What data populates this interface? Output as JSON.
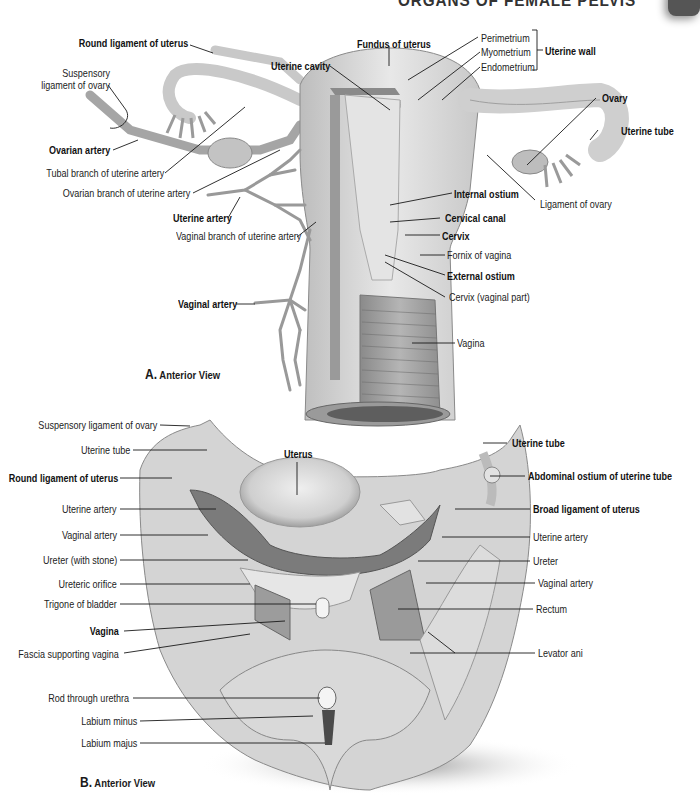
{
  "header": {
    "title": "ORGANS OF FEMALE PELVIS"
  },
  "figure_a": {
    "caption_letter": "A.",
    "caption_text": "Anterior View",
    "labels": [
      {
        "id": "round-ligament-of-uterus",
        "text": "Round ligament of uterus",
        "bold": true
      },
      {
        "id": "suspensory-ligament-of-ovary",
        "text": "Suspensory\nligament of ovary",
        "bold": false
      },
      {
        "id": "ovarian-artery",
        "text": "Ovarian artery",
        "bold": true
      },
      {
        "id": "tubal-branch-of-uterine-artery",
        "text": "Tubal branch of uterine artery",
        "bold": false
      },
      {
        "id": "ovarian-branch-of-uterine-artery",
        "text": "Ovarian branch of uterine artery",
        "bold": false
      },
      {
        "id": "uterine-artery",
        "text": "Uterine artery",
        "bold": true
      },
      {
        "id": "vaginal-branch-of-uterine-artery",
        "text": "Vaginal branch of uterine artery",
        "bold": false
      },
      {
        "id": "vaginal-artery",
        "text": "Vaginal artery",
        "bold": true
      },
      {
        "id": "uterine-cavity",
        "text": "Uterine cavity",
        "bold": true
      },
      {
        "id": "fundus-of-uterus",
        "text": "Fundus of uterus",
        "bold": true
      },
      {
        "id": "perimetrium",
        "text": "Perimetrium",
        "bold": false
      },
      {
        "id": "myometrium",
        "text": "Myometrium",
        "bold": false
      },
      {
        "id": "endometrium",
        "text": "Endometrium",
        "bold": false
      },
      {
        "id": "uterine-wall",
        "text": "Uterine wall",
        "bold": true
      },
      {
        "id": "ovary",
        "text": "Ovary",
        "bold": true
      },
      {
        "id": "uterine-tube",
        "text": "Uterine tube",
        "bold": true
      },
      {
        "id": "ligament-of-ovary",
        "text": "Ligament of ovary",
        "bold": false
      },
      {
        "id": "internal-ostium",
        "text": "Internal ostium",
        "bold": true
      },
      {
        "id": "cervical-canal",
        "text": "Cervical canal",
        "bold": true
      },
      {
        "id": "cervix",
        "text": "Cervix",
        "bold": true
      },
      {
        "id": "fornix-of-vagina",
        "text": "Fornix of vagina",
        "bold": false
      },
      {
        "id": "external-ostium",
        "text": "External ostium",
        "bold": true
      },
      {
        "id": "cervix-vaginal-part",
        "text": "Cervix (vaginal part)",
        "bold": false
      },
      {
        "id": "vagina",
        "text": "Vagina",
        "bold": false
      }
    ]
  },
  "figure_b": {
    "caption_letter": "B.",
    "caption_text": "Anterior View",
    "labels": [
      {
        "id": "suspensory-ligament-of-ovary",
        "text": "Suspensory ligament of ovary",
        "bold": false
      },
      {
        "id": "uterine-tube-left",
        "text": "Uterine tube",
        "bold": false
      },
      {
        "id": "round-ligament-of-uterus",
        "text": "Round ligament of uterus",
        "bold": true
      },
      {
        "id": "uterine-artery-left",
        "text": "Uterine artery",
        "bold": false
      },
      {
        "id": "vaginal-artery-left",
        "text": "Vaginal artery",
        "bold": false
      },
      {
        "id": "ureter-with-stone",
        "text": "Ureter (with stone)",
        "bold": false
      },
      {
        "id": "ureteric-orifice",
        "text": "Ureteric orifice",
        "bold": false
      },
      {
        "id": "trigone-of-bladder",
        "text": "Trigone of bladder",
        "bold": false
      },
      {
        "id": "vagina",
        "text": "Vagina",
        "bold": true
      },
      {
        "id": "fascia-supporting-vagina",
        "text": "Fascia supporting vagina",
        "bold": false
      },
      {
        "id": "rod-through-urethra",
        "text": "Rod through urethra",
        "bold": false
      },
      {
        "id": "labium-minus",
        "text": "Labium minus",
        "bold": false
      },
      {
        "id": "labium-majus",
        "text": "Labium majus",
        "bold": false
      },
      {
        "id": "uterus",
        "text": "Uterus",
        "bold": true
      },
      {
        "id": "uterine-tube-right",
        "text": "Uterine tube",
        "bold": true
      },
      {
        "id": "abdominal-ostium-of-uterine-tube",
        "text": "Abdominal ostium of uterine tube",
        "bold": true
      },
      {
        "id": "broad-ligament-of-uterus",
        "text": "Broad ligament of uterus",
        "bold": true
      },
      {
        "id": "uterine-artery-right",
        "text": "Uterine artery",
        "bold": false
      },
      {
        "id": "ureter",
        "text": "Ureter",
        "bold": false
      },
      {
        "id": "vaginal-artery-right",
        "text": "Vaginal artery",
        "bold": false
      },
      {
        "id": "rectum",
        "text": "Rectum",
        "bold": false
      },
      {
        "id": "levator-ani",
        "text": "Levator ani",
        "bold": false
      }
    ]
  },
  "colors": {
    "tissue_light": "#e6e6e6",
    "tissue_mid": "#c4c4c4",
    "tissue_dark": "#7a7a7a",
    "leader_line": "#1a1a1a",
    "tab": "#555555"
  }
}
